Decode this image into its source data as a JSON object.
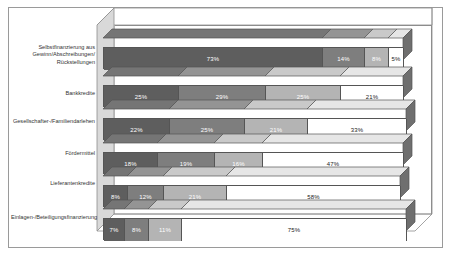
{
  "chart_data": {
    "type": "bar",
    "subtype": "stacked-horizontal-3d",
    "title": "",
    "xlabel": "",
    "ylabel": "",
    "xlim": [
      0,
      100
    ],
    "grid": false,
    "legend": "none",
    "value_suffix": "%",
    "categories": [
      "Selbstfinanzierung aus\nGewinn/Abschreibungen/\nRückstellungen",
      "Bankkredite",
      "Gesellschafter-/Familiendarlehen",
      "Fördermittel",
      "Lieferantenkredite",
      "Einlagen-/Beteiligungsfinanzierung"
    ],
    "series": [
      {
        "name": "Segment 1",
        "color": "#5e5e5e",
        "values": [
          73,
          25,
          22,
          18,
          8,
          7
        ]
      },
      {
        "name": "Segment 2",
        "color": "#7e7e7e",
        "values": [
          14,
          29,
          25,
          19,
          12,
          8
        ]
      },
      {
        "name": "Segment 3",
        "color": "#b4b4b4",
        "values": [
          8,
          25,
          21,
          16,
          21,
          11
        ]
      },
      {
        "name": "Segment 4",
        "color": "#ffffff",
        "values": [
          5,
          21,
          33,
          47,
          58,
          75
        ]
      }
    ],
    "labels": [
      [
        "73%",
        "14%",
        "8%",
        "5%"
      ],
      [
        "25%",
        "29%",
        "25%",
        "21%"
      ],
      [
        "22%",
        "25%",
        "21%",
        "33%"
      ],
      [
        "18%",
        "19%",
        "16%",
        "47%"
      ],
      [
        "8%",
        "12%",
        "21%",
        "58%"
      ],
      [
        "7%",
        "8%",
        "11%",
        "75%"
      ]
    ]
  },
  "frame": {
    "border_color": "#9a9a9a"
  }
}
